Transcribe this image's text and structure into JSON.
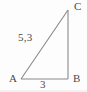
{
  "figure": {
    "type": "right-triangle-diagram",
    "background_color": "#fdfdfd",
    "stroke_color": "#8a8a8a",
    "text_color": "#4a4a4a",
    "vertices": {
      "A": {
        "label": "A",
        "x": 21,
        "y": 79
      },
      "B": {
        "label": "B",
        "x": 68,
        "y": 79
      },
      "C": {
        "label": "C",
        "x": 68,
        "y": 10
      }
    },
    "sides": [
      {
        "name": "hypotenuse-AC",
        "label": "5,3",
        "from": "A",
        "to": "C"
      },
      {
        "name": "base-AB",
        "label": "3",
        "from": "A",
        "to": "B"
      },
      {
        "name": "vertical-BC",
        "label": "",
        "from": "B",
        "to": "C"
      }
    ],
    "labels": {
      "vertex_a": "A",
      "vertex_b": "B",
      "vertex_c": "C",
      "hypotenuse_length": "5,3",
      "base_length": "3"
    }
  }
}
